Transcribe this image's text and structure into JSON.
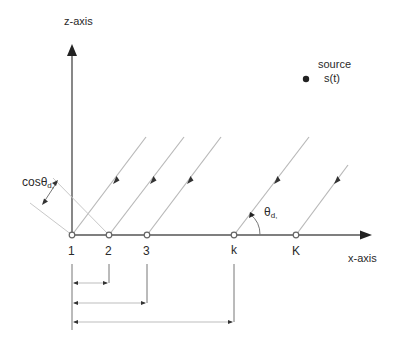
{
  "diagram": {
    "type": "uniform-linear-array-plane-wave",
    "axes": {
      "z_label": "z-axis",
      "x_label": "x-axis"
    },
    "source": {
      "label_line1": "source",
      "label_line2": "s(t)"
    },
    "sensors": [
      {
        "id": "1",
        "label": "1",
        "x": 72
      },
      {
        "id": "2",
        "label": "2",
        "x": 109
      },
      {
        "id": "3",
        "label": "3",
        "x": 147
      },
      {
        "id": "k",
        "label": "k",
        "x": 234
      },
      {
        "id": "K",
        "label": "K",
        "x": 296
      }
    ],
    "angle": {
      "symbol": "θ",
      "subscript": "d,"
    },
    "path_difference": {
      "prefix": "cosθ",
      "subscript": "d,"
    },
    "distance_markers": [
      {
        "from": "1",
        "to": "2"
      },
      {
        "from": "1",
        "to": "3"
      },
      {
        "from": "1",
        "to": "k"
      }
    ],
    "colors": {
      "axis": "#555555",
      "ray": "#b8b8b8",
      "text": "#2a2a2a"
    }
  }
}
